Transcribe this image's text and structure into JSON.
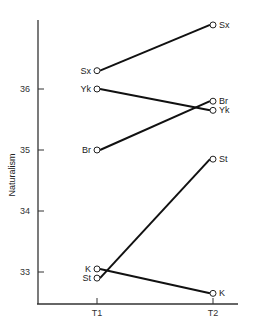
{
  "chart_data": {
    "type": "line",
    "title": "",
    "xlabel": "",
    "ylabel": "Naturalism",
    "categories": [
      "T1",
      "T2"
    ],
    "yticks": [
      33,
      34,
      35,
      36
    ],
    "ylim": [
      32.5,
      37.3
    ],
    "grid": false,
    "legend": "none (points labeled directly)",
    "series": [
      {
        "name": "Sx",
        "values": [
          36.3,
          37.05
        ]
      },
      {
        "name": "Yk",
        "values": [
          36.0,
          35.65
        ]
      },
      {
        "name": "Br",
        "values": [
          35.0,
          35.8
        ]
      },
      {
        "name": "St",
        "values": [
          32.9,
          34.85
        ]
      },
      {
        "name": "K",
        "values": [
          33.05,
          32.65
        ]
      }
    ]
  },
  "axis": {
    "y_label": "Naturalism",
    "x_ticks": [
      "T1",
      "T2"
    ],
    "y_ticks": [
      "33",
      "34",
      "35",
      "36"
    ]
  }
}
